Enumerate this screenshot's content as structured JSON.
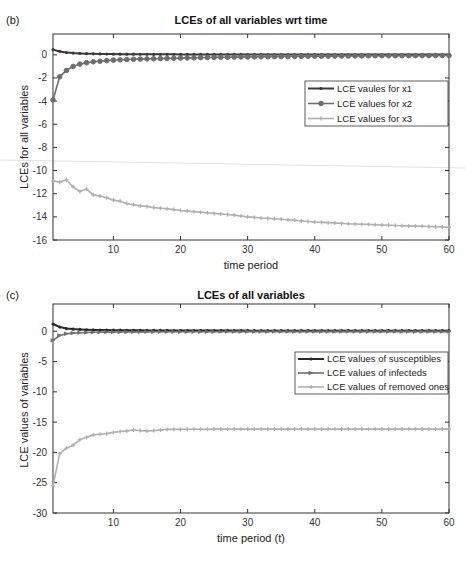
{
  "chart_data": [
    {
      "panel": "(b)",
      "type": "line",
      "title": "LCEs of all variables wrt time",
      "xlabel": "time period",
      "ylabel": "LCEs for all variables",
      "xlim": [
        1,
        60
      ],
      "ylim": [
        -16,
        1.8
      ],
      "xticks": [
        10,
        20,
        30,
        40,
        50,
        60
      ],
      "yticks": [
        0,
        -2,
        -4,
        -6,
        -8,
        -10,
        -12,
        -14,
        -16
      ],
      "grid": false,
      "legend_position": "right-middle",
      "series": [
        {
          "name": "LCE vaules for x1",
          "color": "#3a3a3a",
          "marker": "dot",
          "x": [
            1,
            2,
            3,
            4,
            5,
            6,
            7,
            8,
            9,
            10,
            15,
            20,
            25,
            30,
            35,
            40,
            45,
            50,
            55,
            60
          ],
          "y": [
            0.45,
            0.3,
            0.2,
            0.15,
            0.12,
            0.1,
            0.09,
            0.08,
            0.07,
            0.06,
            0.05,
            0.04,
            0.04,
            0.03,
            0.03,
            0.03,
            0.03,
            0.03,
            0.03,
            0.03
          ]
        },
        {
          "name": "LCE values for x2",
          "color": "#6e6e6e",
          "marker": "circle",
          "x": [
            1,
            2,
            3,
            4,
            5,
            6,
            7,
            8,
            9,
            10,
            12,
            15,
            20,
            25,
            30,
            35,
            40,
            45,
            50,
            55,
            60
          ],
          "y": [
            -3.9,
            -1.9,
            -1.35,
            -1.0,
            -0.8,
            -0.68,
            -0.6,
            -0.55,
            -0.5,
            -0.46,
            -0.4,
            -0.35,
            -0.28,
            -0.22,
            -0.18,
            -0.15,
            -0.12,
            -0.1,
            -0.08,
            -0.07,
            -0.06
          ]
        },
        {
          "name": "LCE values for x3",
          "color": "#b0b0b0",
          "marker": "plus",
          "x": [
            1,
            2,
            3,
            4,
            5,
            6,
            7,
            8,
            9,
            10,
            11,
            12,
            13,
            14,
            15,
            16,
            18,
            20,
            22,
            25,
            28,
            30,
            32,
            35,
            38,
            40,
            42,
            45,
            48,
            50,
            52,
            55,
            58,
            60
          ],
          "y": [
            -10.9,
            -11.0,
            -10.8,
            -11.4,
            -11.8,
            -11.6,
            -12.1,
            -12.2,
            -12.35,
            -12.55,
            -12.65,
            -12.85,
            -12.95,
            -13.05,
            -13.1,
            -13.2,
            -13.3,
            -13.45,
            -13.55,
            -13.7,
            -13.85,
            -14.0,
            -14.1,
            -14.2,
            -14.35,
            -14.45,
            -14.5,
            -14.6,
            -14.65,
            -14.7,
            -14.75,
            -14.8,
            -14.85,
            -14.9
          ]
        }
      ]
    },
    {
      "panel": "(c)",
      "type": "line",
      "title": "LCEs of all variables",
      "xlabel": "time period (t)",
      "ylabel": "LCE values of variables",
      "xlim": [
        1,
        60
      ],
      "ylim": [
        -30,
        4.5
      ],
      "xticks": [
        10,
        20,
        30,
        40,
        50,
        60
      ],
      "yticks": [
        0,
        -5,
        -10,
        -15,
        -20,
        -25,
        -30
      ],
      "grid": false,
      "legend_position": "right-top",
      "series": [
        {
          "name": "LCE values of susceptibles",
          "color": "#2a2a2a",
          "marker": "dot",
          "x": [
            1,
            2,
            3,
            4,
            5,
            6,
            8,
            10,
            15,
            20,
            30,
            40,
            50,
            60
          ],
          "y": [
            1.2,
            0.7,
            0.45,
            0.35,
            0.3,
            0.25,
            0.2,
            0.18,
            0.15,
            0.12,
            0.1,
            0.1,
            0.1,
            0.1
          ]
        },
        {
          "name": "LCE values of infecteds",
          "color": "#6e6e6e",
          "marker": "triangle",
          "x": [
            1,
            2,
            3,
            4,
            5,
            6,
            8,
            10,
            15,
            20,
            30,
            40,
            50,
            60
          ],
          "y": [
            -1.5,
            -0.7,
            -0.4,
            -0.3,
            -0.25,
            -0.2,
            -0.15,
            -0.12,
            -0.1,
            -0.08,
            -0.06,
            -0.05,
            -0.05,
            -0.05
          ]
        },
        {
          "name": "LCE values of removed ones",
          "color": "#b0b0b0",
          "marker": "plus",
          "x": [
            1,
            2,
            3,
            4,
            5,
            6,
            7,
            8,
            9,
            10,
            11,
            12,
            13,
            14,
            15,
            16,
            17,
            18,
            20,
            25,
            30,
            35,
            40,
            45,
            50,
            55,
            60
          ],
          "y": [
            -25.5,
            -20.2,
            -19.3,
            -18.8,
            -17.9,
            -17.5,
            -17.1,
            -17.0,
            -16.9,
            -16.7,
            -16.55,
            -16.45,
            -16.3,
            -16.4,
            -16.45,
            -16.4,
            -16.3,
            -16.2,
            -16.2,
            -16.15,
            -16.15,
            -16.15,
            -16.15,
            -16.15,
            -16.15,
            -16.15,
            -16.15
          ]
        }
      ]
    }
  ]
}
